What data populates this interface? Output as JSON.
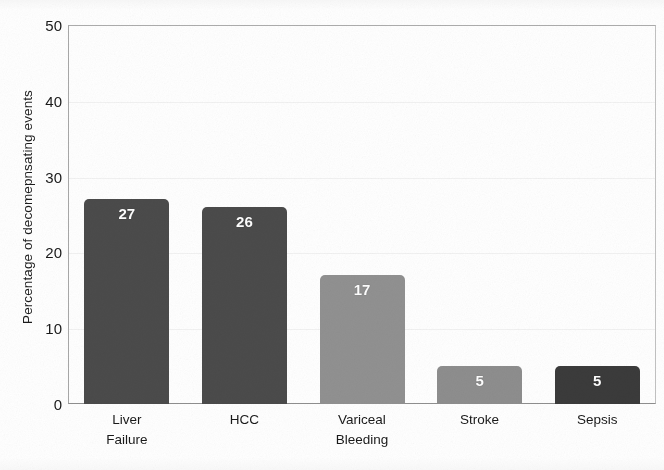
{
  "chart_data": {
    "type": "bar",
    "title": "",
    "subtitle": "",
    "xlabel": "",
    "ylabel": "Percentage of decomepnsating events",
    "categories": [
      "Liver Failure",
      "HCC",
      "Variceal Bleeding",
      "Stroke",
      "Sepsis"
    ],
    "category_lines": [
      [
        "Liver",
        "Failure"
      ],
      [
        "HCC"
      ],
      [
        "Variceal",
        "Bleeding"
      ],
      [
        "Stroke"
      ],
      [
        "Sepsis"
      ]
    ],
    "values": [
      27,
      26,
      17,
      5,
      5
    ],
    "value_labels": [
      "27",
      "26",
      "17",
      "5",
      "5"
    ],
    "bar_colors": [
      "#4b4b4b",
      "#4b4b4b",
      "#919191",
      "#8e8e8e",
      "#3b3b3b"
    ],
    "value_label_color": "#ffffff",
    "ylim": [
      0,
      50
    ],
    "y_ticks": [
      0,
      10,
      20,
      30,
      40,
      50
    ],
    "y_tick_labels": [
      "0",
      "10",
      "20",
      "30",
      "40",
      "50"
    ],
    "grid": true,
    "grid_color": "#f2f2f2",
    "legend": null,
    "legend_position": "none",
    "plot_background": "#ffffff",
    "frame_color": "#b0b0b0"
  },
  "figure": {
    "background": "#ffffff",
    "axis_text_color": "#1a1a1a"
  }
}
